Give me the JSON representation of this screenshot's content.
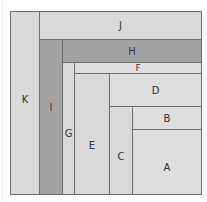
{
  "diagram": {
    "type": "nested-rectangles",
    "regions": [
      {
        "id": "K",
        "label": "K",
        "shade": "light"
      },
      {
        "id": "J",
        "label": "J",
        "shade": "light"
      },
      {
        "id": "I",
        "label": "I",
        "shade": "dark"
      },
      {
        "id": "H",
        "label": "H",
        "shade": "dark"
      },
      {
        "id": "G",
        "label": "G",
        "shade": "light"
      },
      {
        "id": "F",
        "label": "F",
        "shade": "light"
      },
      {
        "id": "E",
        "label": "E",
        "shade": "light"
      },
      {
        "id": "D",
        "label": "D",
        "shade": "light"
      },
      {
        "id": "C",
        "label": "C",
        "shade": "light"
      },
      {
        "id": "B",
        "label": "B",
        "shade": "light"
      },
      {
        "id": "A",
        "label": "A",
        "shade": "light"
      }
    ],
    "colors": {
      "light": "#d9d9d9",
      "dark": "#a3a3a3",
      "border": "#6e6e6e"
    }
  }
}
